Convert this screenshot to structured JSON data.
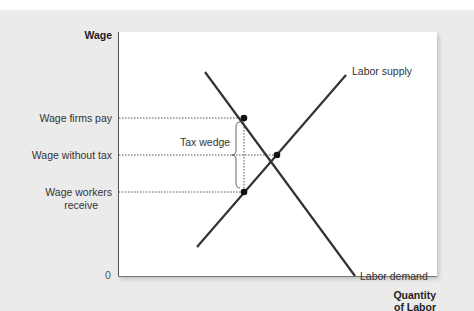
{
  "axes": {
    "y_label": "Wage",
    "x_label_line1": "Quantity",
    "x_label_line2": "of Labor",
    "origin": "0"
  },
  "y_levels": {
    "firms_pay": "Wage firms pay",
    "without_tax": "Wage without tax",
    "workers_receive_line1": "Wage workers",
    "workers_receive_line2": "receive"
  },
  "curves": {
    "supply": "Labor supply",
    "demand": "Labor demand"
  },
  "annotation": {
    "tax_wedge": "Tax wedge"
  },
  "colors": {
    "background": "#ebebeb",
    "plot": "#ffffff",
    "line": "#333333",
    "dotted": "#555555"
  }
}
